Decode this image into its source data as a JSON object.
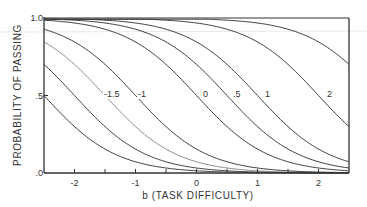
{
  "chart_data": {
    "type": "line",
    "title": "",
    "xlabel": "b (TASK DIFFICULTY)",
    "ylabel": "PROBABILITY OF PASSING",
    "xlim": [
      -2.5,
      2.5
    ],
    "ylim": [
      0,
      1.0
    ],
    "x_ticks": [
      -2,
      -1.5,
      -1,
      -0.5,
      0,
      0.5,
      1,
      1.5,
      2
    ],
    "x_tick_labels": [
      {
        "value": -2,
        "label": "-2"
      },
      {
        "value": -1,
        "label": "-1"
      },
      {
        "value": 0,
        "label": "0"
      },
      {
        "value": 1,
        "label": "1"
      },
      {
        "value": 2,
        "label": "2"
      }
    ],
    "y_tick_labels": [
      {
        "value": 0,
        "label": ".0"
      },
      {
        "value": 0.5,
        "label": ".5"
      },
      {
        "value": 1.0,
        "label": "1.0"
      }
    ],
    "grid": false,
    "legend": "none (curves labeled inline)",
    "model": "P = 1 / (1 + exp(-1.7 (theta - b)))",
    "x": [
      -2.5,
      -2,
      -1.5,
      -1,
      -0.5,
      0,
      0.5,
      1,
      1.5,
      2,
      2.5
    ],
    "series": [
      {
        "name": "-1.5",
        "label": "-1.5",
        "theta": -1.5,
        "values": [
          0.85,
          0.7,
          0.5,
          0.3,
          0.15,
          0.07,
          0.03,
          0.01,
          0.005,
          0.002,
          0.001
        ]
      },
      {
        "name": "-1",
        "label": "-1",
        "theta": -1,
        "values": [
          0.93,
          0.85,
          0.7,
          0.5,
          0.3,
          0.15,
          0.07,
          0.03,
          0.01,
          0.005,
          0.002
        ]
      },
      {
        "name": "0",
        "label": "0",
        "theta": 0,
        "values": [
          0.99,
          0.97,
          0.93,
          0.85,
          0.7,
          0.5,
          0.3,
          0.15,
          0.07,
          0.03,
          0.01
        ]
      },
      {
        "name": ".5",
        "label": ".5",
        "theta": 0.5,
        "values": [
          1.0,
          0.99,
          0.97,
          0.93,
          0.85,
          0.7,
          0.5,
          0.3,
          0.15,
          0.07,
          0.03
        ]
      },
      {
        "name": "1",
        "label": "1",
        "theta": 1,
        "values": [
          1.0,
          1.0,
          0.99,
          0.97,
          0.93,
          0.85,
          0.7,
          0.5,
          0.3,
          0.15,
          0.07
        ]
      },
      {
        "name": "2",
        "label": "2",
        "theta": 2,
        "values": [
          1.0,
          1.0,
          1.0,
          1.0,
          0.99,
          0.97,
          0.93,
          0.85,
          0.7,
          0.5,
          0.3
        ]
      }
    ],
    "extra_unlabeled_series_thetas": [
      -2.5,
      -2,
      3
    ],
    "label_positions": [
      {
        "label": "-1.5",
        "x_px": 104,
        "y_px": 97
      },
      {
        "label": "-1",
        "x_px": 138,
        "y_px": 97
      },
      {
        "label": "0",
        "x_px": 203,
        "y_px": 97
      },
      {
        "label": ".5",
        "x_px": 233,
        "y_px": 97
      },
      {
        "label": "1",
        "x_px": 265,
        "y_px": 97
      },
      {
        "label": "2",
        "x_px": 327,
        "y_px": 97
      }
    ]
  },
  "colors": {
    "axis": "#333333",
    "curve": "#3a3a3a",
    "curve_light": "#8a8a8a",
    "text": "#333333"
  }
}
